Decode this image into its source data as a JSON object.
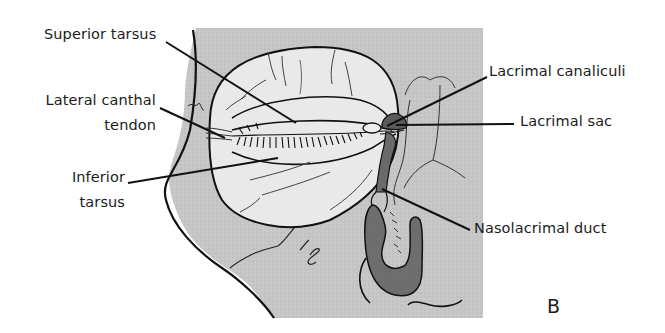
{
  "figure": {
    "panel_letter": "B",
    "colors": {
      "background": "#ffffff",
      "skin_gray": "#c9c9c9",
      "eye_light": "#ececec",
      "duct_dark": "#6e6e6e",
      "sac_dark": "#5a5a5a",
      "line": "#111111"
    }
  },
  "labels": {
    "superior_tarsus": "Superior tarsus",
    "lateral_canthal_tendon_line1": "Lateral canthal",
    "lateral_canthal_tendon_line2": "tendon",
    "inferior_tarsus_line1": "Inferior",
    "inferior_tarsus_line2": "tarsus",
    "lacrimal_canaliculi": "Lacrimal canaliculi",
    "lacrimal_sac": "Lacrimal sac",
    "nasolacrimal_duct": "Nasolacrimal duct"
  }
}
